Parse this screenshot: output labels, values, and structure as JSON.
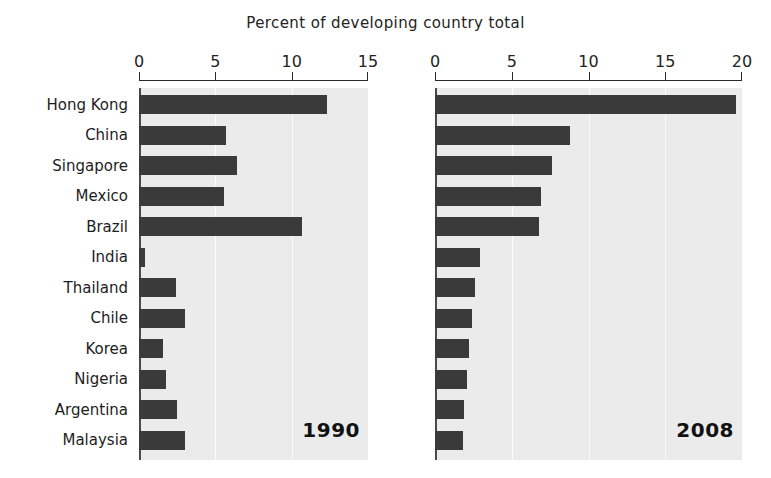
{
  "chart_data": {
    "type": "bar",
    "orientation": "horizontal",
    "title": "Percent of developing country total",
    "xlabel": "",
    "ylabel": "",
    "grid": true,
    "legend": "none",
    "categories": [
      "Hong Kong",
      "China",
      "Singapore",
      "Mexico",
      "Brazil",
      "India",
      "Thailand",
      "Chile",
      "Korea",
      "Nigeria",
      "Argentina",
      "Malaysia"
    ],
    "panels": [
      {
        "name": "1990",
        "annotation": "1990",
        "xlim": [
          0,
          15
        ],
        "xticks": [
          0,
          5,
          10,
          15
        ],
        "xtick_labels": [
          "0",
          "5",
          "10",
          "15"
        ],
        "values": [
          12.3,
          5.7,
          6.4,
          5.6,
          10.7,
          0.4,
          2.4,
          3.0,
          1.6,
          1.8,
          2.5,
          3.0
        ]
      },
      {
        "name": "2008",
        "annotation": "2008",
        "xlim": [
          0,
          20
        ],
        "xticks": [
          0,
          5,
          10,
          15,
          20
        ],
        "xtick_labels": [
          "0",
          "5",
          "10",
          "15",
          "20"
        ],
        "values": [
          19.6,
          8.8,
          7.6,
          6.9,
          6.8,
          2.9,
          2.6,
          2.4,
          2.2,
          2.1,
          1.9,
          1.8
        ]
      }
    ],
    "colors": {
      "bar": "#3a3a3a",
      "plot_background": "#ebebeb",
      "gridline": "#fbfbfb",
      "axis": "#2a2a2a",
      "text": "#1d1d1d"
    }
  }
}
